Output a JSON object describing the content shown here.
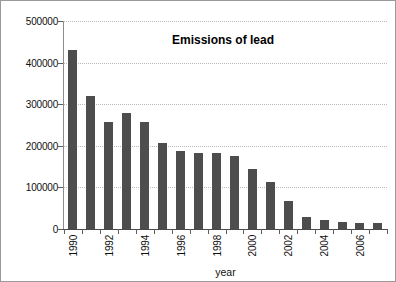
{
  "chart_data": {
    "type": "bar",
    "title": "Emissions of lead",
    "xlabel": "year",
    "ylabel": "kgPb/year",
    "categories": [
      1990,
      1991,
      1992,
      1993,
      1994,
      1995,
      1996,
      1997,
      1998,
      1999,
      2000,
      2001,
      2002,
      2003,
      2004,
      2005,
      2006,
      2007
    ],
    "values": [
      430000,
      320000,
      258000,
      278000,
      257000,
      206000,
      188000,
      182000,
      182000,
      175000,
      145000,
      112000,
      68000,
      30000,
      22000,
      16000,
      14000,
      14000
    ],
    "series": [
      {
        "name": "Emissions of lead",
        "values": [
          430000,
          320000,
          258000,
          278000,
          257000,
          206000,
          188000,
          182000,
          182000,
          175000,
          145000,
          112000,
          68000,
          30000,
          22000,
          16000,
          14000,
          14000
        ]
      }
    ],
    "ylim": [
      0,
      500000
    ],
    "yticks": [
      0,
      100000,
      200000,
      300000,
      400000,
      500000
    ],
    "ytick_labels": [
      "0",
      "100000",
      "200000",
      "300000",
      "400000",
      "500000"
    ],
    "xtick_labels": [
      "1990",
      "1992",
      "1994",
      "1996",
      "1998",
      "2000",
      "2002",
      "2004",
      "2006"
    ],
    "xtick_label_indices": [
      0,
      2,
      4,
      6,
      8,
      10,
      12,
      14,
      16
    ],
    "grid": true,
    "legend": false,
    "bar_color": "#4d4d4d",
    "grid_color": "#b9b9b9",
    "axis_color": "#4a4a4a",
    "background_color": "#ffffff",
    "border_color": "#9a9a9a"
  }
}
